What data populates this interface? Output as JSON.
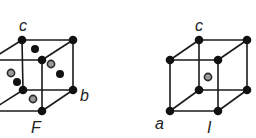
{
  "figure": {
    "colors": {
      "edge": "#1a1a1a",
      "corner_atom": "#111111",
      "center_atom_fill": "#9a9a9a",
      "background": "#ffffff"
    }
  },
  "cells": [
    {
      "id": "face-centered",
      "lattice_type_label": "F",
      "axis_labels": {
        "c": "c",
        "b": "b"
      },
      "corners": [
        {
          "pos": "back-top-left",
          "x": 22,
          "y": 40
        },
        {
          "pos": "back-top-right",
          "x": 73,
          "y": 40
        },
        {
          "pos": "front-top-right",
          "x": 42,
          "y": 60
        },
        {
          "pos": "back-bottom-left",
          "x": 23,
          "y": 90
        },
        {
          "pos": "back-bottom-right",
          "x": 73,
          "y": 90
        },
        {
          "pos": "front-bottom-right",
          "x": 42,
          "y": 111
        }
      ],
      "face_centers_black": [
        {
          "x": 35,
          "y": 49
        },
        {
          "x": 60,
          "y": 74
        },
        {
          "x": 17,
          "y": 82
        }
      ],
      "face_centers_gray": [
        {
          "x": 51,
          "y": 64
        },
        {
          "x": 11,
          "y": 73
        },
        {
          "x": 33,
          "y": 99
        }
      ]
    },
    {
      "id": "body-centered",
      "lattice_type_label": "I",
      "axis_labels": {
        "c": "c",
        "a": "a"
      },
      "corners": [
        {
          "pos": "back-top-left",
          "x": 199,
          "y": 40
        },
        {
          "pos": "back-top-right",
          "x": 247,
          "y": 40
        },
        {
          "pos": "front-top-left",
          "x": 170,
          "y": 60
        },
        {
          "pos": "front-top-right",
          "x": 218,
          "y": 60
        },
        {
          "pos": "back-bottom-left",
          "x": 199,
          "y": 90
        },
        {
          "pos": "back-bottom-right",
          "x": 247,
          "y": 90
        },
        {
          "pos": "front-bottom-left",
          "x": 170,
          "y": 111
        },
        {
          "pos": "front-bottom-right",
          "x": 218,
          "y": 111
        }
      ],
      "body_center_gray": {
        "x": 208,
        "y": 77
      }
    }
  ]
}
